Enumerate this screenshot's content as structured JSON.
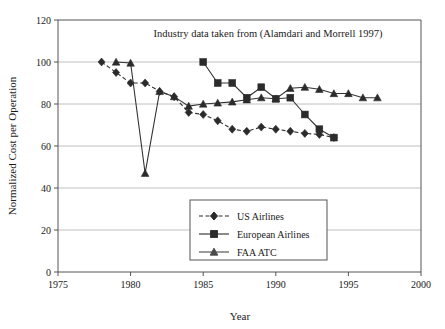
{
  "chart_data": {
    "type": "line",
    "title": "Industry data taken from (Alamdari and Morrell 1997)",
    "xlabel": "Year",
    "ylabel": "Normalized Cost per Operation",
    "xlim": [
      1975,
      2000
    ],
    "ylim": [
      0,
      120
    ],
    "xticks": [
      1975,
      1980,
      1985,
      1990,
      1995,
      2000
    ],
    "yticks": [
      0,
      20,
      40,
      60,
      80,
      100,
      120
    ],
    "grid": "horizontal",
    "legend_position": "lower-center",
    "series": [
      {
        "name": "US Airlines",
        "marker": "diamond",
        "linestyle": "dashed",
        "color": "#2b2b2b",
        "x": [
          1978,
          1979,
          1980,
          1981,
          1982,
          1983,
          1984,
          1985,
          1986,
          1987,
          1988,
          1989,
          1990,
          1991,
          1992,
          1993,
          1994
        ],
        "values": [
          100,
          95,
          90,
          90,
          86,
          83.5,
          76,
          75,
          72,
          68,
          67,
          69,
          68,
          67,
          66,
          65.5,
          64
        ]
      },
      {
        "name": "European Airlines",
        "marker": "square",
        "linestyle": "solid",
        "color": "#2b2b2b",
        "x": [
          1985,
          1986,
          1987,
          1988,
          1989,
          1990,
          1991,
          1992,
          1993,
          1994
        ],
        "values": [
          100,
          90,
          90,
          83,
          88,
          82.5,
          83,
          75,
          68,
          64
        ]
      },
      {
        "name": "FAA ATC",
        "marker": "triangle",
        "linestyle": "solid",
        "color": "#4a4a4a",
        "x": [
          1979,
          1980,
          1981,
          1982,
          1983,
          1984,
          1985,
          1986,
          1987,
          1988,
          1989,
          1990,
          1991,
          1992,
          1993,
          1994,
          1995,
          1996,
          1997
        ],
        "values": [
          100,
          99.5,
          47,
          86,
          83.5,
          79,
          80,
          80.5,
          81,
          82,
          83,
          82.5,
          87.5,
          88,
          87,
          85,
          85,
          83,
          83
        ]
      }
    ]
  },
  "axis": {
    "y_title": "Normalized Cost per Operation",
    "x_title": "Year",
    "y_tick_0": "0",
    "y_tick_20": "20",
    "y_tick_40": "40",
    "y_tick_60": "60",
    "y_tick_80": "80",
    "y_tick_100": "100",
    "y_tick_120": "120",
    "x_tick_1975": "1975",
    "x_tick_1980": "1980",
    "x_tick_1985": "1985",
    "x_tick_1990": "1990",
    "x_tick_1995": "1995",
    "x_tick_2000": "2000"
  },
  "legend": {
    "items": [
      {
        "label": "US Airlines"
      },
      {
        "label": "European Airlines"
      },
      {
        "label": "FAA ATC"
      }
    ]
  }
}
